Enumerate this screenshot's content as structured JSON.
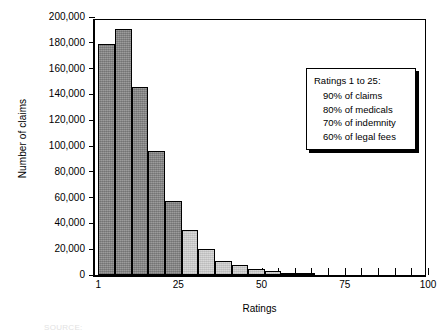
{
  "chart_data": {
    "type": "bar",
    "title": "",
    "xlabel": "Ratings",
    "ylabel": "Number of claims",
    "xlim": [
      0,
      100
    ],
    "ylim": [
      0,
      200000
    ],
    "grid": false,
    "legend": null,
    "bin_width": 5,
    "x_tick_values": [
      1,
      25,
      50,
      75,
      100
    ],
    "x_tick_labels": [
      "1",
      "25",
      "50",
      "75",
      "100"
    ],
    "x_minor_ticks": [
      5,
      10,
      15,
      20,
      30,
      35,
      40,
      45,
      55,
      60,
      65,
      70,
      80,
      85,
      90,
      95
    ],
    "y_tick_values": [
      0,
      20000,
      40000,
      60000,
      80000,
      100000,
      120000,
      140000,
      160000,
      180000,
      200000
    ],
    "y_tick_labels": [
      "0",
      "20,000",
      "40,000",
      "60,000",
      "80,000",
      "100,000",
      "120,000",
      "140,000",
      "160,000",
      "180,000",
      "200,000"
    ],
    "series": [
      {
        "name": "Number of claims",
        "bins": [
          {
            "x_start": 1,
            "x_end": 6,
            "value": 179000,
            "shade": "dark"
          },
          {
            "x_start": 6,
            "x_end": 11,
            "value": 191000,
            "shade": "dark"
          },
          {
            "x_start": 11,
            "x_end": 16,
            "value": 146000,
            "shade": "dark"
          },
          {
            "x_start": 16,
            "x_end": 21,
            "value": 96000,
            "shade": "dark"
          },
          {
            "x_start": 21,
            "x_end": 26,
            "value": 57000,
            "shade": "dark"
          },
          {
            "x_start": 26,
            "x_end": 31,
            "value": 35000,
            "shade": "light"
          },
          {
            "x_start": 31,
            "x_end": 36,
            "value": 20500,
            "shade": "light"
          },
          {
            "x_start": 36,
            "x_end": 41,
            "value": 11000,
            "shade": "light"
          },
          {
            "x_start": 41,
            "x_end": 46,
            "value": 7500,
            "shade": "light"
          },
          {
            "x_start": 46,
            "x_end": 51,
            "value": 5000,
            "shade": "light"
          },
          {
            "x_start": 51,
            "x_end": 56,
            "value": 3000,
            "shade": "light"
          },
          {
            "x_start": 56,
            "x_end": 61,
            "value": 1500,
            "shade": "light"
          },
          {
            "x_start": 61,
            "x_end": 66,
            "value": 1000,
            "shade": "light"
          }
        ]
      }
    ],
    "annotations": [
      {
        "name": "ratings-summary-box",
        "title": "Ratings 1 to 25:",
        "lines": [
          "90% of claims",
          "80% of medicals",
          "70% of indemnity",
          "60% of legal fees"
        ]
      }
    ],
    "colors": {
      "bar_dark": "#8c8c8c",
      "bar_light": "#cfcfcf",
      "axis": "#000000",
      "background": "#ffffff",
      "text": "#000000"
    }
  },
  "footer": {
    "text": "SOURCE:"
  }
}
